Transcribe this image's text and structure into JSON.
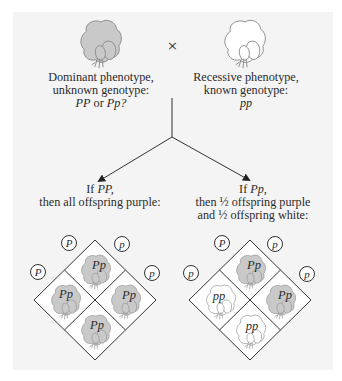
{
  "colors": {
    "panel_bg": "#f4f4f4",
    "purple_flower_fill": "#c9c9c9",
    "white_flower_fill": "#ffffff",
    "flower_stroke": "#8a8a8a",
    "line": "#333333"
  },
  "parents": {
    "cross_symbol": "×",
    "dominant": {
      "flower_icon": "purple-flower-icon",
      "lines": [
        "Dominant phenotype,",
        "unknown genotype:"
      ],
      "genotype_a": "PP",
      "genotype_or": " or ",
      "genotype_b": "Pp?"
    },
    "recessive": {
      "flower_icon": "white-flower-icon",
      "lines": [
        "Recessive phenotype,",
        "known genotype:"
      ],
      "genotype": "pp"
    }
  },
  "outcomes": {
    "left": {
      "if_prefix": "If ",
      "if_genotype": "PP,",
      "lines": [
        "then all offspring purple:"
      ],
      "gametes": {
        "top_left": "P",
        "top_right": "p",
        "left": "P",
        "right": "p"
      },
      "cells": [
        {
          "position": "top",
          "genotype": "Pp",
          "phenotype": "purple"
        },
        {
          "position": "left",
          "genotype": "Pp",
          "phenotype": "purple"
        },
        {
          "position": "right",
          "genotype": "Pp",
          "phenotype": "purple"
        },
        {
          "position": "bottom",
          "genotype": "Pp",
          "phenotype": "purple"
        }
      ]
    },
    "right": {
      "if_prefix": "If ",
      "if_genotype": "Pp,",
      "lines": [
        "then ½ offspring purple",
        "and ½ offspring white:"
      ],
      "gametes": {
        "top_left": "P",
        "top_right": "p",
        "left": "p",
        "right": "p"
      },
      "cells": [
        {
          "position": "top",
          "genotype": "Pp",
          "phenotype": "purple"
        },
        {
          "position": "left",
          "genotype": "pp",
          "phenotype": "white"
        },
        {
          "position": "right",
          "genotype": "Pp",
          "phenotype": "purple"
        },
        {
          "position": "bottom",
          "genotype": "pp",
          "phenotype": "white"
        }
      ]
    }
  }
}
